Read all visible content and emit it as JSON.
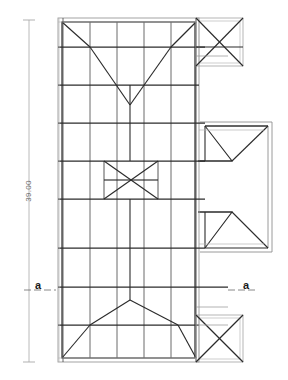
{
  "drawing": {
    "type": "roof-plan",
    "title": "",
    "background_color": "#ffffff",
    "line_color": "#2b2b2b",
    "thin_line_color": "#9a9a9a",
    "dimension_color": "#8a8a8a",
    "label_color": "#1a1a1a"
  },
  "dimension": {
    "name": "overall-length",
    "value": "39.00",
    "orientation": "vertical",
    "rotation_deg": -90,
    "x": 29,
    "y_start": 20,
    "y_end": 362,
    "label_x": 29,
    "label_y": 191
  },
  "section_markers": [
    {
      "name": "section-marker-left",
      "label": "a",
      "x": 37,
      "y": 289,
      "tick_x1": 24,
      "tick_x2": 56,
      "tick_y": 290
    },
    {
      "name": "section-marker-right",
      "label": "a",
      "x": 246,
      "y": 289,
      "tick_x1": 228,
      "tick_x2": 262,
      "tick_y": 290
    }
  ],
  "geometry": {
    "main_outline": {
      "name": "main-roof-outline",
      "x1": 58,
      "y1": 18,
      "x2": 199,
      "y2": 362,
      "inner_inset": 4
    },
    "grid_vertical_x": [
      63,
      90,
      117,
      144,
      171,
      196
    ],
    "grid_horizontal_y": [
      47,
      85,
      123,
      161,
      199,
      248,
      287,
      325
    ],
    "ridge_x": 130,
    "hip_apex_top": {
      "x": 130,
      "y": 105
    },
    "hip_apex_bottom": {
      "x": 130,
      "y": 300
    },
    "bowtie": {
      "name": "center-bowtie",
      "left_x": 104,
      "right_x": 158,
      "top_y": 161,
      "bottom_y": 199,
      "mid_y": 180,
      "peak_left_x": 131,
      "peak_right_x": 131
    },
    "corner_braces": [
      {
        "name": "x-brace-top-right",
        "x1": 196,
        "y1": 18,
        "x2": 243,
        "y2": 66
      },
      {
        "name": "x-brace-bottom-right",
        "x1": 196,
        "y1": 315,
        "x2": 243,
        "y2": 362
      }
    ],
    "right_wing": {
      "name": "right-wing-extension",
      "x1": 198,
      "y1": 125,
      "x2": 272,
      "y2": 250,
      "wall_thickness": 4,
      "hip_top_y": 145,
      "hip_bottom_y": 230,
      "notch_x": 212
    }
  }
}
